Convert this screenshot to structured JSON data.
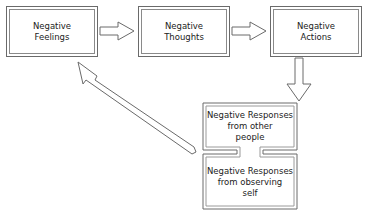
{
  "diagram": {
    "nodes": [
      {
        "id": "feelings",
        "label": "Negative\nFeelings"
      },
      {
        "id": "thoughts",
        "label": "Negative\nThoughts"
      },
      {
        "id": "actions",
        "label": "Negative\nActions"
      },
      {
        "id": "responses_others",
        "label": "Negative Responses\nfrom other\npeople"
      },
      {
        "id": "responses_self",
        "label": "Negative Responses\nfrom observing\nself"
      }
    ],
    "edges": [
      {
        "from": "feelings",
        "to": "thoughts"
      },
      {
        "from": "thoughts",
        "to": "actions"
      },
      {
        "from": "actions",
        "to": "responses_others"
      },
      {
        "from": "responses_group",
        "to": "feelings"
      }
    ],
    "colors": {
      "stroke": "#6a6a6a",
      "fill": "#ffffff",
      "text": "#222222"
    }
  }
}
